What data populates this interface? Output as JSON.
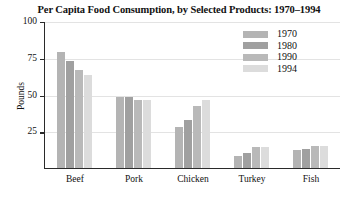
{
  "chart_data": {
    "type": "bar",
    "title": "Per Capita Food Consumption, by Selected Products: 1970–1994",
    "xlabel": "",
    "ylabel": "Pounds",
    "ylim": [
      0,
      100
    ],
    "yticks": [
      25,
      50,
      75,
      100
    ],
    "grid": true,
    "legend_position": "top-right",
    "categories": [
      "Beef",
      "Pork",
      "Chicken",
      "Turkey",
      "Fish"
    ],
    "series": [
      {
        "name": "1970",
        "color": "#b4b4b4",
        "values": [
          79,
          48,
          28,
          8,
          12
        ]
      },
      {
        "name": "1980",
        "color": "#a0a0a0",
        "values": [
          73,
          48,
          33,
          10,
          13
        ]
      },
      {
        "name": "1990",
        "color": "#b9b9b9",
        "values": [
          67,
          46,
          42,
          14,
          15
        ]
      },
      {
        "name": "1994",
        "color": "#dcdcdc",
        "values": [
          63,
          46,
          46,
          14,
          15
        ]
      }
    ]
  }
}
